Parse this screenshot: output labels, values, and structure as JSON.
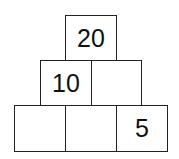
{
  "puzzle": {
    "type": "number-pyramid",
    "rows": [
      {
        "cells": [
          "20"
        ]
      },
      {
        "cells": [
          "10",
          ""
        ]
      },
      {
        "cells": [
          "",
          "",
          "5"
        ]
      }
    ]
  },
  "colors": {
    "border": "#222222",
    "background": "#ffffff",
    "text": "#111111"
  }
}
